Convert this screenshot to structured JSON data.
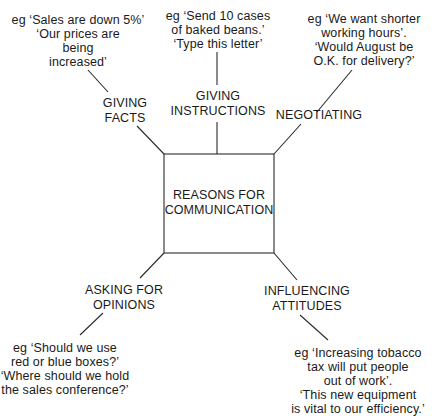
{
  "diagram": {
    "center": {
      "label": "REASONS FOR\nCOMMUNICATION"
    },
    "branches": [
      {
        "id": "giving-facts",
        "label": "GIVING\nFACTS",
        "example": "eg ‘Sales are down 5%’\n‘Our prices are\nbeing\nincreased’"
      },
      {
        "id": "giving-instructions",
        "label": "GIVING\nINSTRUCTIONS",
        "example": "eg ‘Send 10 cases\nof baked beans.’\n‘Type this letter’"
      },
      {
        "id": "negotiating",
        "label": "NEGOTIATING",
        "example": "eg ‘We want shorter\nworking hours’.\n‘Would August be\nO.K. for delivery?’"
      },
      {
        "id": "asking-for-opinions",
        "label": "ASKING FOR\nOPINIONS",
        "example": "eg ‘Should we use\nred or blue boxes?’\n‘Where should we hold\nthe sales conference?’"
      },
      {
        "id": "influencing-attitudes",
        "label": "INFLUENCING\nATTITUDES",
        "example": "eg ‘Increasing tobacco\ntax will put people\nout of work’.\n‘This new equipment\nis vital to our efficiency.’"
      }
    ],
    "colors": {
      "line": "#2a2a2a",
      "text": "#1a1a1a",
      "background": "#ffffff"
    }
  }
}
